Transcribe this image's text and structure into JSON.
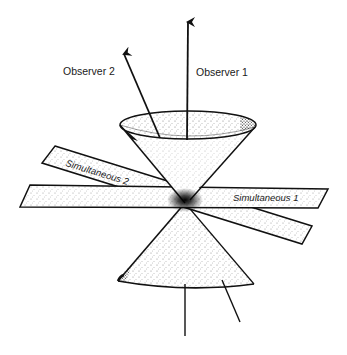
{
  "diagram": {
    "type": "light-cone-simultaneity",
    "labels": {
      "observer_1": "Observer 1",
      "observer_2": "Observer 2",
      "simultaneous_1": "Simultaneous 1",
      "simultaneous_2": "Simultaneous 2"
    },
    "colors": {
      "ink": "#111111",
      "background": "#ffffff",
      "stipple": "#222222"
    }
  }
}
